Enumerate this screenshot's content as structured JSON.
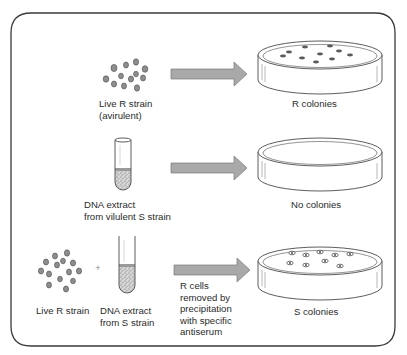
{
  "figure": {
    "colors": {
      "border": "#3a3a3a",
      "arrow_fill": "#a9a9a9",
      "arrow_stroke": "#7a7a7a",
      "cell_fill": "#8e8e8e",
      "cell_stroke": "#4a4a4a",
      "plate_stroke": "#4a4a4a",
      "colony_fill": "#5a5a5a",
      "sediment_fill": "#bdbdbd"
    },
    "rows": [
      {
        "input_labels": [
          "Live R strain",
          "(avirulent)"
        ],
        "result_label": "R colonies",
        "arrow_note": null
      },
      {
        "input_labels": [
          "DNA extract",
          "from vilulent S strain"
        ],
        "result_label": "No colonies",
        "arrow_note": null
      },
      {
        "input_labels_left": [
          "Live R strain"
        ],
        "plus_sign": "+",
        "input_labels_right": [
          "DNA extract",
          "from S strain"
        ],
        "result_label": "S colonies",
        "arrow_note": [
          "R cells",
          "removed by",
          "precipitation",
          "with specific",
          "antiserum"
        ]
      }
    ]
  }
}
